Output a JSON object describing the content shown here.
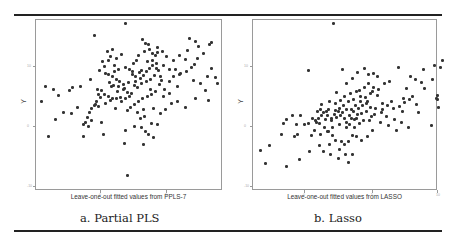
{
  "captions": [
    "a. Partial PLS",
    "b. Lasso"
  ],
  "chart_data": [
    {
      "type": "scatter",
      "title": "a. Partial PLS",
      "xlabel": "Leave-one-out fitted values from PPLS-7",
      "ylabel": "Y",
      "x_ticks": [
        "0",
        "5"
      ],
      "y_ticks": [
        "10",
        "0",
        "-10"
      ],
      "grid": false,
      "legend": null,
      "points_px": [
        [
          86,
          0
        ],
        [
          55,
          12
        ],
        [
          63,
          38
        ],
        [
          72,
          63
        ],
        [
          51,
          56
        ],
        [
          33,
          64
        ],
        [
          6,
          63
        ],
        [
          32,
          90
        ],
        [
          24,
          89
        ],
        [
          9,
          113
        ],
        [
          2,
          78
        ],
        [
          19,
          72
        ],
        [
          16,
          96
        ],
        [
          38,
          84
        ],
        [
          52,
          97
        ],
        [
          44,
          113
        ],
        [
          76,
          85
        ],
        [
          101,
          95
        ],
        [
          106,
          108
        ],
        [
          85,
          120
        ],
        [
          104,
          121
        ],
        [
          88,
          152
        ],
        [
          64,
          111
        ],
        [
          81,
          74
        ],
        [
          30,
          67
        ],
        [
          41,
          63
        ],
        [
          14,
          66
        ],
        [
          62,
          99
        ],
        [
          59,
          71
        ],
        [
          104,
          86
        ],
        [
          109,
          111
        ],
        [
          114,
          114
        ],
        [
          118,
          101
        ],
        [
          121,
          90
        ],
        [
          126,
          86
        ],
        [
          132,
          80
        ],
        [
          138,
          78
        ],
        [
          146,
          84
        ],
        [
          156,
          75
        ],
        [
          148,
          27
        ],
        [
          159,
          23
        ],
        [
          146,
          36
        ],
        [
          152,
          44
        ],
        [
          155,
          41
        ],
        [
          158,
          35
        ],
        [
          164,
          30
        ],
        [
          172,
          45
        ],
        [
          176,
          54
        ],
        [
          168,
          53
        ],
        [
          154,
          57
        ],
        [
          138,
          63
        ],
        [
          130,
          70
        ],
        [
          124,
          73
        ],
        [
          111,
          66
        ],
        [
          96,
          58
        ],
        [
          100,
          49
        ],
        [
          94,
          40
        ],
        [
          102,
          47
        ],
        [
          108,
          38
        ],
        [
          113,
          37
        ],
        [
          116,
          32
        ],
        [
          118,
          29
        ],
        [
          106,
          20
        ],
        [
          103,
          16
        ],
        [
          109,
          21
        ],
        [
          118,
          24
        ],
        [
          123,
          28
        ],
        [
          127,
          33
        ],
        [
          134,
          37
        ],
        [
          140,
          32
        ],
        [
          136,
          46
        ],
        [
          130,
          46
        ],
        [
          124,
          42
        ],
        [
          117,
          45
        ],
        [
          115,
          52
        ],
        [
          111,
          56
        ],
        [
          107,
          58
        ],
        [
          102,
          60
        ],
        [
          98,
          64
        ],
        [
          95,
          62
        ],
        [
          89,
          59
        ],
        [
          84,
          61
        ],
        [
          80,
          58
        ],
        [
          77,
          56
        ],
        [
          73,
          53
        ],
        [
          69,
          51
        ],
        [
          66,
          50
        ],
        [
          70,
          59
        ],
        [
          74,
          62
        ],
        [
          79,
          63
        ],
        [
          84,
          66
        ],
        [
          88,
          69
        ],
        [
          92,
          70
        ],
        [
          90,
          73
        ],
        [
          86,
          75
        ],
        [
          82,
          78
        ],
        [
          77,
          75
        ],
        [
          73,
          75
        ],
        [
          69,
          73
        ],
        [
          65,
          71
        ],
        [
          62,
          67
        ],
        [
          58,
          66
        ],
        [
          61,
          74
        ],
        [
          57,
          78
        ],
        [
          55,
          82
        ],
        [
          52,
          85
        ],
        [
          50,
          89
        ],
        [
          48,
          94
        ],
        [
          46,
          99
        ],
        [
          44,
          101
        ],
        [
          49,
          103
        ],
        [
          56,
          81
        ],
        [
          59,
          83
        ],
        [
          66,
          80
        ],
        [
          71,
          77
        ],
        [
          78,
          68
        ],
        [
          85,
          65
        ],
        [
          93,
          48
        ],
        [
          96,
          53
        ],
        [
          101,
          55
        ],
        [
          104,
          52
        ],
        [
          107,
          48
        ],
        [
          110,
          45
        ],
        [
          113,
          42
        ],
        [
          117,
          40
        ],
        [
          119,
          47
        ],
        [
          121,
          53
        ],
        [
          120,
          61
        ],
        [
          116,
          68
        ],
        [
          112,
          71
        ],
        [
          108,
          73
        ],
        [
          103,
          75
        ],
        [
          99,
          78
        ],
        [
          95,
          81
        ],
        [
          91,
          84
        ],
        [
          88,
          87
        ],
        [
          98,
          89
        ],
        [
          105,
          93
        ],
        [
          114,
          85
        ],
        [
          95,
          103
        ],
        [
          86,
          107
        ],
        [
          102,
          104
        ],
        [
          112,
          100
        ],
        [
          125,
          66
        ],
        [
          130,
          58
        ],
        [
          134,
          53
        ],
        [
          141,
          50
        ],
        [
          147,
          48
        ],
        [
          166,
          67
        ],
        [
          170,
          21
        ],
        [
          172,
          19
        ],
        [
          169,
          77
        ],
        [
          178,
          60
        ],
        [
          161,
          60
        ],
        [
          150,
          15
        ],
        [
          156,
          18
        ],
        [
          140,
          51
        ],
        [
          122,
          57
        ],
        [
          75,
          42
        ],
        [
          69,
          37
        ],
        [
          65,
          43
        ],
        [
          60,
          47
        ],
        [
          71,
          33
        ],
        [
          77,
          35
        ],
        [
          82,
          31
        ],
        [
          79,
          46
        ],
        [
          75,
          48
        ],
        [
          86,
          44
        ],
        [
          90,
          46
        ],
        [
          93,
          51
        ],
        [
          97,
          37
        ],
        [
          99,
          32
        ],
        [
          105,
          28
        ],
        [
          110,
          26
        ],
        [
          113,
          30
        ],
        [
          68,
          28
        ],
        [
          73,
          26
        ]
      ],
      "frame_px": [
        186,
        170
      ]
    },
    {
      "type": "scatter",
      "title": "b. Lasso",
      "xlabel": "Leave-one-out fitted values from LASSO",
      "ylabel": "Y",
      "x_ticks": [
        "0",
        "5",
        "10"
      ],
      "y_ticks": [
        "10",
        "0",
        "-10"
      ],
      "grid": false,
      "legend": null,
      "points_px": [
        [
          77,
          0
        ],
        [
          52,
          47
        ],
        [
          86,
          46
        ],
        [
          96,
          55
        ],
        [
          101,
          49
        ],
        [
          108,
          45
        ],
        [
          112,
          51
        ],
        [
          117,
          50
        ],
        [
          121,
          53
        ],
        [
          128,
          60
        ],
        [
          133,
          58
        ],
        [
          142,
          44
        ],
        [
          154,
          53
        ],
        [
          159,
          56
        ],
        [
          165,
          59
        ],
        [
          167,
          46
        ],
        [
          176,
          56
        ],
        [
          184,
          44
        ],
        [
          186,
          37
        ],
        [
          180,
          75
        ],
        [
          181,
          76
        ],
        [
          147,
          75
        ],
        [
          178,
          42
        ],
        [
          168,
          65
        ],
        [
          160,
          81
        ],
        [
          146,
          88
        ],
        [
          126,
          80
        ],
        [
          116,
          68
        ],
        [
          135,
          78
        ],
        [
          121,
          72
        ],
        [
          111,
          78
        ],
        [
          90,
          60
        ],
        [
          80,
          69
        ],
        [
          73,
          78
        ],
        [
          70,
          88
        ],
        [
          62,
          95
        ],
        [
          60,
          99
        ],
        [
          72,
          86
        ],
        [
          94,
          70
        ],
        [
          100,
          68
        ],
        [
          104,
          73
        ],
        [
          65,
          81
        ],
        [
          61,
          88
        ],
        [
          44,
          92
        ],
        [
          36,
          92
        ],
        [
          30,
          96
        ],
        [
          27,
          100
        ],
        [
          40,
          101
        ],
        [
          41,
          111
        ],
        [
          38,
          113
        ],
        [
          25,
          111
        ],
        [
          13,
          122
        ],
        [
          4,
          127
        ],
        [
          9,
          140
        ],
        [
          30,
          143
        ],
        [
          43,
          136
        ],
        [
          53,
          128
        ],
        [
          67,
          128
        ],
        [
          73,
          121
        ],
        [
          83,
          126
        ],
        [
          92,
          139
        ],
        [
          96,
          131
        ],
        [
          89,
          131
        ],
        [
          82,
          135
        ],
        [
          74,
          131
        ],
        [
          63,
          122
        ],
        [
          55,
          112
        ],
        [
          48,
          101
        ],
        [
          52,
          100
        ],
        [
          58,
          107
        ],
        [
          64,
          111
        ],
        [
          71,
          108
        ],
        [
          76,
          104
        ],
        [
          83,
          101
        ],
        [
          90,
          104
        ],
        [
          98,
          104
        ],
        [
          103,
          100
        ],
        [
          107,
          97
        ],
        [
          113,
          97
        ],
        [
          118,
          91
        ],
        [
          125,
          89
        ],
        [
          130,
          93
        ],
        [
          138,
          96
        ],
        [
          145,
          99
        ],
        [
          152,
          104
        ],
        [
          140,
          107
        ],
        [
          132,
          102
        ],
        [
          124,
          99
        ],
        [
          116,
          107
        ],
        [
          111,
          113
        ],
        [
          105,
          117
        ],
        [
          100,
          113
        ],
        [
          96,
          112
        ],
        [
          92,
          118
        ],
        [
          88,
          121
        ],
        [
          85,
          118
        ],
        [
          79,
          117
        ],
        [
          76,
          112
        ],
        [
          72,
          108
        ],
        [
          68,
          104
        ],
        [
          63,
          100
        ],
        [
          59,
          97
        ],
        [
          56,
          95
        ],
        [
          65,
          92
        ],
        [
          69,
          96
        ],
        [
          75,
          97
        ],
        [
          80,
          94
        ],
        [
          84,
          92
        ],
        [
          88,
          95
        ],
        [
          93,
          92
        ],
        [
          97,
          88
        ],
        [
          102,
          85
        ],
        [
          106,
          82
        ],
        [
          110,
          80
        ],
        [
          114,
          84
        ],
        [
          119,
          85
        ],
        [
          126,
          86
        ],
        [
          131,
          82
        ],
        [
          137,
          85
        ],
        [
          143,
          83
        ],
        [
          148,
          79
        ],
        [
          153,
          76
        ],
        [
          156,
          73
        ],
        [
          109,
          74
        ],
        [
          104,
          78
        ],
        [
          99,
          82
        ],
        [
          95,
          86
        ],
        [
          90,
          86
        ],
        [
          86,
          89
        ],
        [
          82,
          88
        ],
        [
          78,
          91
        ],
        [
          75,
          95
        ],
        [
          71,
          92
        ],
        [
          67,
          89
        ],
        [
          64,
          86
        ],
        [
          79,
          80
        ],
        [
          84,
          77
        ],
        [
          88,
          73
        ],
        [
          92,
          78
        ],
        [
          97,
          76
        ],
        [
          103,
          67
        ],
        [
          108,
          64
        ],
        [
          112,
          60
        ],
        [
          117,
          64
        ],
        [
          122,
          66
        ],
        [
          114,
          70
        ],
        [
          150,
          65
        ],
        [
          162,
          89
        ],
        [
          175,
          102
        ],
        [
          181,
          72
        ],
        [
          182,
          84
        ],
        [
          90,
          99
        ],
        [
          95,
          95
        ],
        [
          100,
          95
        ],
        [
          105,
          90
        ],
        [
          110,
          88
        ],
        [
          115,
          93
        ],
        [
          87,
          82
        ],
        [
          83,
          85
        ],
        [
          79,
          87
        ],
        [
          101,
          91
        ],
        [
          93,
          101
        ],
        [
          98,
          96
        ]
      ],
      "frame_px": [
        184,
        170
      ]
    }
  ]
}
